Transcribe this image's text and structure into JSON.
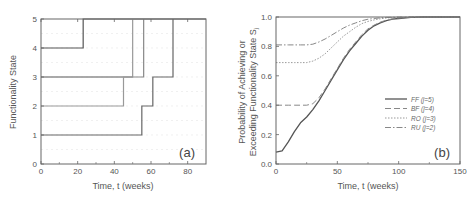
{
  "chart_data": [
    {
      "type": "line",
      "subtype": "step",
      "panel_label": "(a)",
      "title": "",
      "xlabel": "Time, t (weeks)",
      "ylabel": "Functionality State",
      "xlim": [
        0,
        90
      ],
      "ylim": [
        0,
        5
      ],
      "xticks": [
        0,
        20,
        40,
        60,
        80
      ],
      "yticks": [
        0,
        1,
        2,
        3,
        4,
        5
      ],
      "grid": true,
      "series": [
        {
          "name": "path-1",
          "color": "#555555",
          "points": [
            [
              0,
              4
            ],
            [
              23,
              4
            ],
            [
              23,
              5
            ],
            [
              90,
              5
            ]
          ]
        },
        {
          "name": "path-2",
          "color": "#999999",
          "points": [
            [
              0,
              3
            ],
            [
              50,
              3
            ],
            [
              50,
              5
            ]
          ]
        },
        {
          "name": "path-3",
          "color": "#888888",
          "points": [
            [
              0,
              3
            ],
            [
              56,
              3
            ],
            [
              56,
              5
            ]
          ]
        },
        {
          "name": "path-4",
          "color": "#999999",
          "points": [
            [
              0,
              2
            ],
            [
              45,
              2
            ],
            [
              45,
              3
            ],
            [
              50,
              3
            ]
          ]
        },
        {
          "name": "path-5",
          "color": "#666666",
          "points": [
            [
              0,
              1
            ],
            [
              55,
              1
            ],
            [
              55,
              2
            ],
            [
              61,
              2
            ],
            [
              61,
              3
            ],
            [
              72,
              3
            ],
            [
              72,
              5
            ]
          ]
        }
      ]
    },
    {
      "type": "line",
      "panel_label": "(b)",
      "title": "",
      "xlabel": "Time, t (weeks)",
      "ylabel_line1": "Probability of Achieving or",
      "ylabel_line2": "Exceeding Functionality State S",
      "ylabel_sub": "j",
      "xlim": [
        0,
        150
      ],
      "ylim": [
        0,
        1.0
      ],
      "xticks": [
        0,
        50,
        100,
        150
      ],
      "yticks": [
        "0.0",
        "0.2",
        "0.4",
        "0.6",
        "0.8",
        "1.0"
      ],
      "grid": false,
      "legend_position": "lower right",
      "x": [
        0,
        5,
        10,
        15,
        20,
        25,
        30,
        35,
        40,
        45,
        50,
        55,
        60,
        65,
        70,
        75,
        80,
        85,
        90,
        95,
        100,
        110,
        120,
        130,
        150
      ],
      "series": [
        {
          "name": "FF (j=5)",
          "label_main": "FF",
          "label_sub": "(j=5)",
          "dash": "",
          "color": "#555555",
          "values": [
            0.08,
            0.09,
            0.15,
            0.22,
            0.28,
            0.32,
            0.37,
            0.43,
            0.5,
            0.57,
            0.64,
            0.71,
            0.77,
            0.82,
            0.87,
            0.91,
            0.94,
            0.96,
            0.975,
            0.985,
            0.99,
            0.997,
            1.0,
            1.0,
            1.0
          ]
        },
        {
          "name": "BF (j=4)",
          "label_main": "BF",
          "label_sub": "(j=4)",
          "dash": "6,3",
          "color": "#888888",
          "values": [
            0.4,
            0.4,
            0.4,
            0.4,
            0.4,
            0.4,
            0.41,
            0.45,
            0.51,
            0.58,
            0.65,
            0.72,
            0.78,
            0.83,
            0.88,
            0.92,
            0.945,
            0.965,
            0.978,
            0.987,
            0.993,
            0.998,
            1.0,
            1.0,
            1.0
          ]
        },
        {
          "name": "RO (j=3)",
          "label_main": "RO",
          "label_sub": "(j=3)",
          "dash": "1.5,1.5",
          "color": "#999999",
          "values": [
            0.69,
            0.69,
            0.69,
            0.69,
            0.69,
            0.69,
            0.7,
            0.72,
            0.75,
            0.79,
            0.83,
            0.87,
            0.9,
            0.93,
            0.955,
            0.97,
            0.98,
            0.988,
            0.993,
            0.996,
            0.998,
            1.0,
            1.0,
            1.0,
            1.0
          ]
        },
        {
          "name": "RU (j=2)",
          "label_main": "RU",
          "label_sub": "(j=2)",
          "dash": "6,2,1.5,2",
          "color": "#888888",
          "values": [
            0.81,
            0.81,
            0.81,
            0.81,
            0.81,
            0.81,
            0.815,
            0.83,
            0.85,
            0.875,
            0.9,
            0.925,
            0.945,
            0.96,
            0.975,
            0.985,
            0.99,
            0.994,
            0.997,
            0.998,
            0.999,
            1.0,
            1.0,
            1.0,
            1.0
          ]
        }
      ]
    }
  ]
}
